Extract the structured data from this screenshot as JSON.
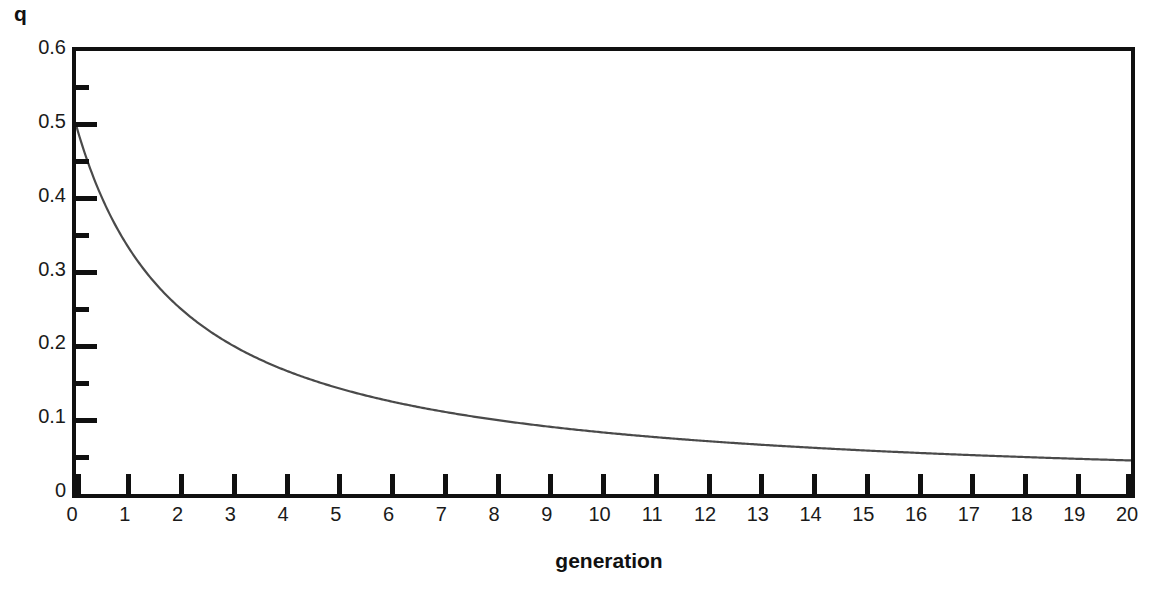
{
  "chart_data": {
    "type": "line",
    "title": "",
    "xlabel": "generation",
    "ylabel": "q",
    "xlim": [
      0,
      20
    ],
    "ylim": [
      0,
      0.6
    ],
    "grid": false,
    "legend": "none",
    "x_tick_labels": [
      "0",
      "1",
      "2",
      "3",
      "4",
      "5",
      "6",
      "7",
      "8",
      "9",
      "10",
      "11",
      "12",
      "13",
      "14",
      "15",
      "16",
      "17",
      "18",
      "19",
      "20"
    ],
    "y_tick_labels": [
      "0",
      "0.1",
      "0.2",
      "0.3",
      "0.4",
      "0.5",
      "0.6"
    ],
    "y_major_ticks": [
      0,
      0.1,
      0.2,
      0.3,
      0.4,
      0.5,
      0.6
    ],
    "y_minor_ticks": [
      0.05,
      0.15,
      0.25,
      0.35,
      0.45,
      0.55
    ],
    "series": [
      {
        "name": "q",
        "color": "#4a4a4a",
        "x": [
          0,
          1,
          2,
          3,
          4,
          5,
          6,
          7,
          8,
          9,
          10,
          11,
          12,
          13,
          14,
          15,
          16,
          17,
          18,
          19,
          20
        ],
        "values": [
          0.5,
          0.333,
          0.25,
          0.2,
          0.167,
          0.143,
          0.125,
          0.111,
          0.1,
          0.091,
          0.083,
          0.077,
          0.071,
          0.067,
          0.063,
          0.059,
          0.056,
          0.053,
          0.05,
          0.048,
          0.045
        ]
      }
    ],
    "annotations": []
  },
  "axis": {
    "y_title": "q",
    "x_title": "generation"
  },
  "caption": {
    "text": ""
  }
}
